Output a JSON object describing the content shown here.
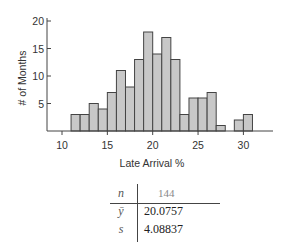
{
  "chart_data": {
    "type": "bar",
    "title": "",
    "xlabel": "Late Arrival %",
    "ylabel": "# of Months",
    "x_bin_start": [
      11,
      12,
      13,
      14,
      15,
      16,
      17,
      18,
      19,
      20,
      21,
      22,
      23,
      24,
      25,
      26,
      27,
      28,
      29,
      30
    ],
    "values": [
      3,
      3,
      5,
      4,
      7,
      11,
      8,
      13,
      18,
      14,
      17,
      13,
      3,
      6,
      6,
      7,
      1,
      0,
      2,
      3
    ],
    "x_ticks": [
      10,
      15,
      20,
      25,
      30
    ],
    "y_ticks": [
      5,
      10,
      15,
      20
    ],
    "xlim": [
      8.5,
      33.5
    ],
    "ylim": [
      0,
      20
    ],
    "grid": false,
    "bar_color": "#c8c8c8",
    "edge_color": "#444444"
  },
  "stats": {
    "n_symbol": "n",
    "n_value": "144",
    "mean_symbol": "ȳ",
    "mean_value": "20.0757",
    "sd_symbol": "s",
    "sd_value": "4.08837"
  }
}
